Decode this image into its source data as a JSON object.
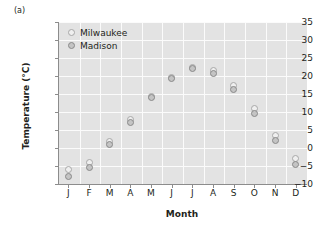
{
  "panel": {
    "label": "(a)"
  },
  "chart_data": {
    "type": "scatter",
    "title": "",
    "xlabel": "Month",
    "ylabel": "Temperature (°C)",
    "categories": [
      "J",
      "F",
      "M",
      "A",
      "M",
      "J",
      "J",
      "A",
      "S",
      "O",
      "N",
      "D"
    ],
    "xtick_labels": [
      "J",
      "F",
      "M",
      "A",
      "M",
      "J",
      "J",
      "A",
      "S",
      "O",
      "N",
      "D"
    ],
    "ytick_labels": [
      "35",
      "30",
      "25",
      "20",
      "15",
      "10",
      "5",
      "0",
      "−5",
      "−10"
    ],
    "ytick_values": [
      35,
      30,
      25,
      20,
      15,
      10,
      5,
      0,
      -5,
      -10
    ],
    "ylim": [
      -10,
      35
    ],
    "grid": true,
    "legend_position": "top-left",
    "series": [
      {
        "name": "Milwaukee",
        "marker": "open-circle",
        "color": "#efefef",
        "edge_color": "#a8a8a8",
        "values": [
          -6.0,
          -4.0,
          1.8,
          7.8,
          14.3,
          19.7,
          22.5,
          21.5,
          17.5,
          11.0,
          3.5,
          -3.0
        ]
      },
      {
        "name": "Madison",
        "marker": "filled-circle",
        "color": "#c4c4c4",
        "edge_color": "#8a8a8a",
        "values": [
          -8.0,
          -5.5,
          1.0,
          7.2,
          13.9,
          19.3,
          22.0,
          20.8,
          16.2,
          9.6,
          2.2,
          -4.7
        ]
      }
    ]
  },
  "legend": {
    "entries": [
      {
        "label": "Milwaukee"
      },
      {
        "label": "Madison"
      }
    ]
  },
  "colors": {
    "plot_background": "#e3e3e3",
    "gridline": "#fbfbfb",
    "axis": "#8c8c8c",
    "text": "#231f20"
  }
}
